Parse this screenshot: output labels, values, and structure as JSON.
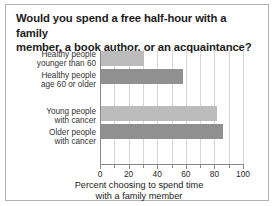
{
  "chart_data": {
    "type": "bar",
    "orientation": "horizontal",
    "title": "Would you spend a free half-hour with a family member, a book author, or an acquaintance?",
    "title_lines": [
      "Would you spend a free half-hour with a family",
      "member, a book author, or an acquaintance?"
    ],
    "categories": [
      "Healthy people younger than 60",
      "Healthy people age 60 or older",
      "Young people with cancer",
      "Older people with cancer"
    ],
    "category_lines": [
      [
        "Healthy people",
        "younger than 60"
      ],
      [
        "Healthy people",
        "age 60 or older"
      ],
      [
        "Young people",
        "with cancer"
      ],
      [
        "Older people",
        "with cancer"
      ]
    ],
    "values": [
      31,
      58,
      82,
      86
    ],
    "bar_styles": [
      "light",
      "dark",
      "light",
      "dark"
    ],
    "xlabel": "Percent choosing to spend time with a family member",
    "xlabel_lines": [
      "Percent choosing to spend time",
      "with a family member"
    ],
    "ylabel": "",
    "xlim": [
      0,
      100
    ],
    "xticks": [
      0,
      20,
      40,
      60,
      80,
      100
    ],
    "xtick_labels": [
      "0",
      "20",
      "40",
      "60",
      "80",
      "100"
    ],
    "minor_xticks": [
      10,
      30,
      50,
      70,
      90
    ],
    "gridlines": [
      10,
      20,
      30,
      40,
      50,
      60,
      70,
      80,
      90,
      100
    ],
    "grid": true,
    "legend": null,
    "colors": {
      "bar_light": "#bcbcbc",
      "bar_dark": "#909090",
      "gridline": "#d6d6d6",
      "axis": "#8a8a8a",
      "text": "#1c1c1c",
      "frame": "#b0b0b0",
      "background": "#ffffff"
    }
  }
}
